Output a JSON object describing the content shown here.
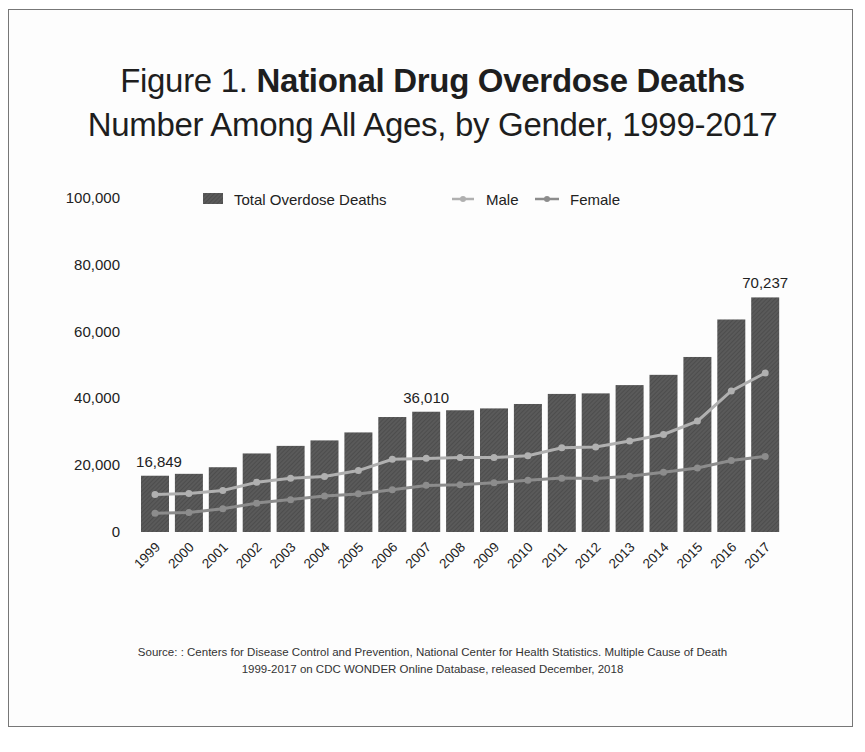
{
  "title": {
    "prefix": "Figure 1. ",
    "main": "National Drug Overdose Deaths",
    "subtitle": "Number Among All Ages, by Gender, 1999-2017"
  },
  "legend": {
    "total": "Total Overdose Deaths",
    "male": "Male",
    "female": "Female"
  },
  "source": {
    "line1": "Source: : Centers for Disease Control and Prevention, National Center for Health Statistics. Multiple Cause of Death",
    "line2": "1999-2017 on CDC WONDER Online Database, released December, 2018"
  },
  "colors": {
    "bar": "#5a5a5a",
    "male": "#b0b0b0",
    "female": "#8c8c8c",
    "text": "#222222"
  },
  "chart_data": {
    "type": "bar",
    "title": "Figure 1. National Drug Overdose Deaths",
    "subtitle": "Number Among All Ages, by Gender, 1999-2017",
    "xlabel": "",
    "ylabel": "",
    "ylim": [
      0,
      100000
    ],
    "yticks": [
      0,
      20000,
      40000,
      60000,
      80000,
      100000
    ],
    "ytick_labels": [
      "0",
      "20,000",
      "40,000",
      "60,000",
      "80,000",
      "100,000"
    ],
    "grid": false,
    "legend_position": "top",
    "categories": [
      "1999",
      "2000",
      "2001",
      "2002",
      "2003",
      "2004",
      "2005",
      "2006",
      "2007",
      "2008",
      "2009",
      "2010",
      "2011",
      "2012",
      "2013",
      "2014",
      "2015",
      "2016",
      "2017"
    ],
    "series": [
      {
        "name": "Total Overdose Deaths",
        "type": "bar",
        "values": [
          16849,
          17415,
          19394,
          23518,
          25785,
          27424,
          29813,
          34425,
          36010,
          36450,
          37004,
          38329,
          41340,
          41502,
          43982,
          47055,
          52404,
          63632,
          70237
        ]
      },
      {
        "name": "Male",
        "type": "line",
        "values": [
          11258,
          11563,
          12438,
          14873,
          16096,
          16653,
          18398,
          21761,
          22050,
          22290,
          22268,
          22853,
          25213,
          25463,
          27264,
          29194,
          33207,
          42237,
          47600
        ]
      },
      {
        "name": "Female",
        "type": "line",
        "values": [
          5591,
          5852,
          6956,
          8645,
          9689,
          10771,
          11415,
          12664,
          13960,
          14160,
          14736,
          15476,
          16127,
          16039,
          16718,
          17861,
          19197,
          21395,
          22637
        ]
      }
    ],
    "annotations": [
      {
        "category": "1999",
        "label": "16,849"
      },
      {
        "category": "2007",
        "label": "36,010"
      },
      {
        "category": "2017",
        "label": "70,237"
      }
    ]
  }
}
